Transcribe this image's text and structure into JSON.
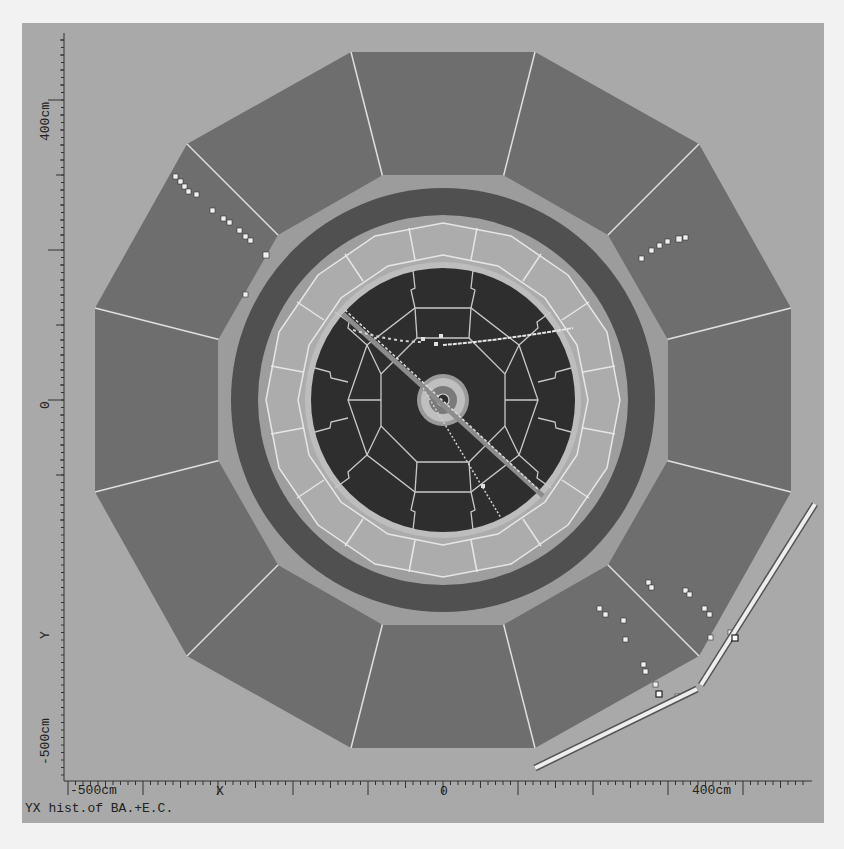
{
  "plot": {
    "caption": "YX hist.of BA.+E.C.",
    "x_axis": {
      "label": "X",
      "ticks": [
        {
          "text": "-500cm"
        },
        {
          "text": "0"
        },
        {
          "text": "400cm"
        }
      ]
    },
    "y_axis": {
      "label": "Y",
      "ticks": [
        {
          "text": "400cm"
        },
        {
          "text": "0"
        },
        {
          "text": "-500cm"
        }
      ]
    }
  },
  "colors": {
    "background": "#a9a9a9",
    "outer_modules": "#6e6e6e",
    "gap_ring": "#9c9c9c",
    "dark_ring": "#505050",
    "inner_calorimeter": "#a0a0a0",
    "inner_core": "#2e2e2e",
    "hits": "#f0f0f0",
    "module_lines": "#e0e0e0"
  }
}
